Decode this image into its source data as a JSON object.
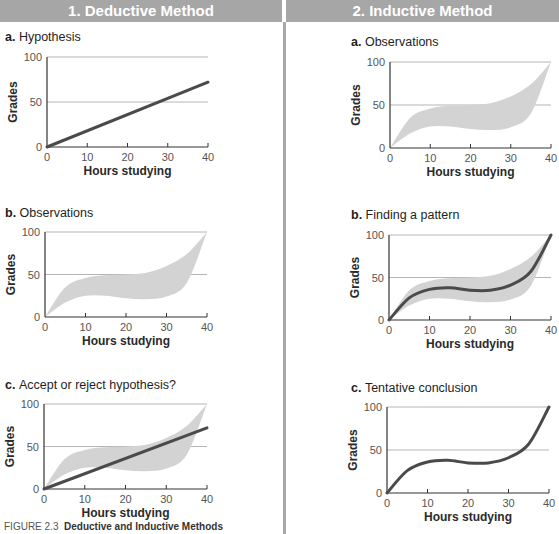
{
  "columns": [
    {
      "label": "1. Deductive Method"
    },
    {
      "label": "2. Inductive Method"
    }
  ],
  "panels": {
    "d_a": {
      "letter": "a.",
      "title": "Hypothesis"
    },
    "d_b": {
      "letter": "b.",
      "title": "Observations"
    },
    "d_c": {
      "letter": "c.",
      "title": "Accept or reject hypothesis?"
    },
    "i_a": {
      "letter": "a.",
      "title": "Observations"
    },
    "i_b": {
      "letter": "b.",
      "title": "Finding a pattern"
    },
    "i_c": {
      "letter": "c.",
      "title": "Tentative conclusion"
    }
  },
  "axes": {
    "xlabel": "Hours studying",
    "ylabel": "Grades",
    "xticks": [
      "0",
      "10",
      "20",
      "30",
      "40"
    ],
    "yticks": [
      "0",
      "50",
      "100"
    ]
  },
  "caption": {
    "figure": "FIGURE 2.3",
    "title": "Deductive and Inductive Methods"
  },
  "colors": {
    "header_bg": "#a6a6a6",
    "line": "#4a4a4a",
    "band": "#d3d3d3",
    "gridline": "#b5b5b5"
  },
  "chart_data": [
    {
      "id": "deductive-a-hypothesis",
      "type": "line",
      "title": "a. Hypothesis",
      "xlabel": "Hours studying",
      "ylabel": "Grades",
      "xlim": [
        0,
        40
      ],
      "ylim": [
        0,
        100
      ],
      "gridlines_y": [
        50,
        100
      ],
      "series": [
        {
          "name": "Hypothesized relationship",
          "x": [
            0,
            40
          ],
          "values": [
            0,
            72
          ]
        }
      ]
    },
    {
      "id": "deductive-b-observations",
      "type": "area",
      "title": "b. Observations",
      "xlabel": "Hours studying",
      "ylabel": "Grades",
      "xlim": [
        0,
        40
      ],
      "ylim": [
        0,
        100
      ],
      "gridlines_y": [
        50,
        100
      ],
      "series": [
        {
          "name": "Observation band upper",
          "x": [
            0,
            5,
            10,
            15,
            20,
            25,
            30,
            35,
            40
          ],
          "values": [
            0,
            35,
            46,
            49,
            50,
            52,
            60,
            74,
            100
          ]
        },
        {
          "name": "Observation band lower",
          "x": [
            0,
            5,
            10,
            15,
            20,
            25,
            30,
            35,
            40
          ],
          "values": [
            0,
            17,
            25,
            25,
            22,
            21,
            24,
            40,
            100
          ]
        }
      ]
    },
    {
      "id": "deductive-c-accept-reject",
      "type": "area",
      "title": "c. Accept or reject hypothesis?",
      "xlabel": "Hours studying",
      "ylabel": "Grades",
      "xlim": [
        0,
        40
      ],
      "ylim": [
        0,
        100
      ],
      "gridlines_y": [
        50,
        100
      ],
      "series": [
        {
          "name": "Observation band upper",
          "x": [
            0,
            5,
            10,
            15,
            20,
            25,
            30,
            35,
            40
          ],
          "values": [
            0,
            35,
            46,
            49,
            50,
            52,
            60,
            74,
            100
          ]
        },
        {
          "name": "Observation band lower",
          "x": [
            0,
            5,
            10,
            15,
            20,
            25,
            30,
            35,
            40
          ],
          "values": [
            0,
            17,
            25,
            25,
            22,
            21,
            24,
            40,
            100
          ]
        },
        {
          "name": "Hypothesized relationship",
          "x": [
            0,
            40
          ],
          "values": [
            0,
            72
          ]
        }
      ]
    },
    {
      "id": "inductive-a-observations",
      "type": "area",
      "title": "a. Observations",
      "xlabel": "Hours studying",
      "ylabel": "Grades",
      "xlim": [
        0,
        40
      ],
      "ylim": [
        0,
        100
      ],
      "gridlines_y": [
        50,
        100
      ],
      "series": [
        {
          "name": "Observation band upper",
          "x": [
            0,
            5,
            10,
            15,
            20,
            25,
            30,
            35,
            40
          ],
          "values": [
            0,
            35,
            46,
            49,
            50,
            52,
            60,
            74,
            100
          ]
        },
        {
          "name": "Observation band lower",
          "x": [
            0,
            5,
            10,
            15,
            20,
            25,
            30,
            35,
            40
          ],
          "values": [
            0,
            17,
            25,
            25,
            22,
            21,
            24,
            40,
            100
          ]
        }
      ]
    },
    {
      "id": "inductive-b-finding-pattern",
      "type": "line",
      "title": "b. Finding a pattern",
      "xlabel": "Hours studying",
      "ylabel": "Grades",
      "xlim": [
        0,
        40
      ],
      "ylim": [
        0,
        100
      ],
      "gridlines_y": [
        50,
        100
      ],
      "series": [
        {
          "name": "Observation band upper",
          "x": [
            0,
            5,
            10,
            15,
            20,
            25,
            30,
            35,
            40
          ],
          "values": [
            0,
            35,
            46,
            49,
            50,
            52,
            60,
            74,
            100
          ]
        },
        {
          "name": "Observation band lower",
          "x": [
            0,
            5,
            10,
            15,
            20,
            25,
            30,
            35,
            40
          ],
          "values": [
            0,
            17,
            25,
            25,
            22,
            21,
            24,
            40,
            100
          ]
        },
        {
          "name": "Pattern",
          "x": [
            0,
            5,
            10,
            15,
            20,
            25,
            30,
            35,
            40
          ],
          "values": [
            0,
            26,
            36,
            38,
            35,
            35,
            41,
            57,
            100
          ]
        }
      ]
    },
    {
      "id": "inductive-c-tentative-conclusion",
      "type": "line",
      "title": "c. Tentative conclusion",
      "xlabel": "Hours studying",
      "ylabel": "Grades",
      "xlim": [
        0,
        40
      ],
      "ylim": [
        0,
        100
      ],
      "gridlines_y": [
        50,
        100
      ],
      "series": [
        {
          "name": "Conclusion curve",
          "x": [
            0,
            5,
            10,
            15,
            20,
            25,
            30,
            35,
            40
          ],
          "values": [
            0,
            26,
            36,
            38,
            35,
            35,
            41,
            57,
            100
          ]
        }
      ]
    }
  ]
}
